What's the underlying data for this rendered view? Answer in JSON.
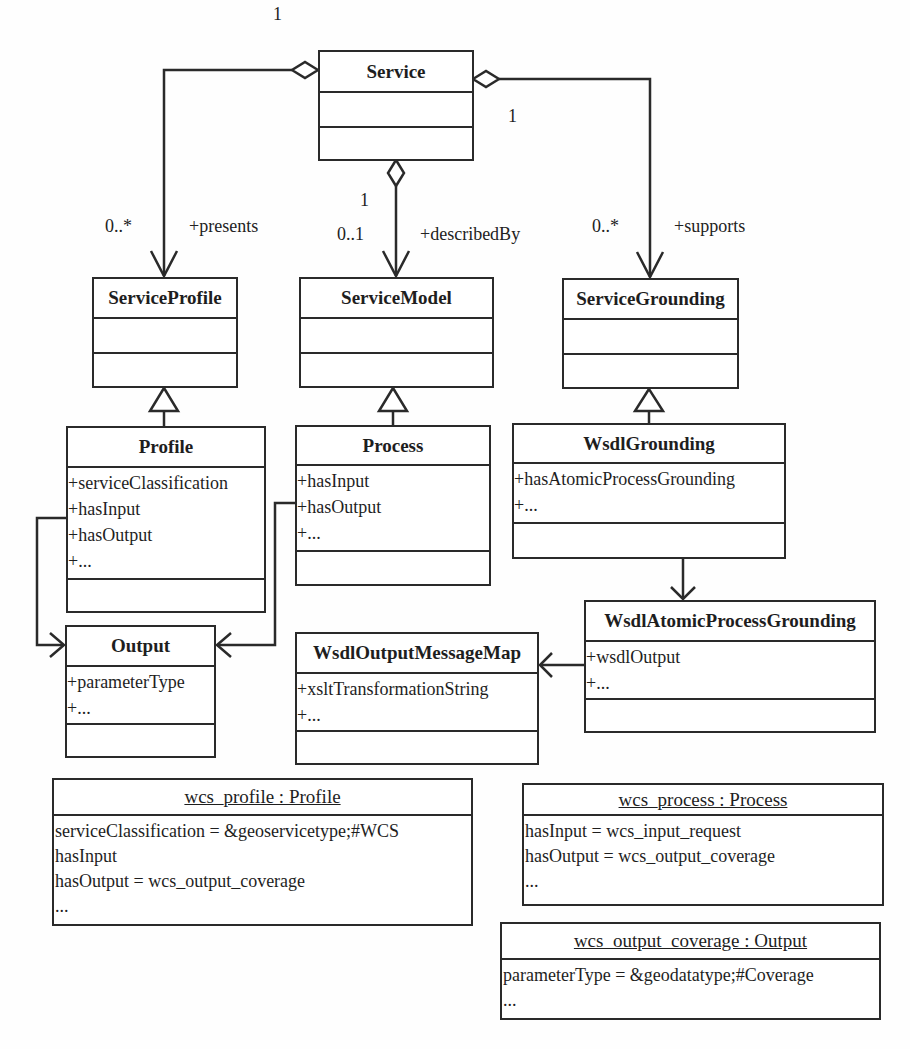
{
  "diagram": {
    "type": "UML class and object diagram",
    "classes": {
      "service": {
        "name": "Service",
        "attributes": [],
        "operations": []
      },
      "service_profile": {
        "name": "ServiceProfile",
        "attributes": [],
        "operations": []
      },
      "service_model": {
        "name": "ServiceModel",
        "attributes": [],
        "operations": []
      },
      "service_grounding": {
        "name": "ServiceGrounding",
        "attributes": [],
        "operations": []
      },
      "profile": {
        "name": "Profile",
        "attributes": [
          "+serviceClassification",
          "+hasInput",
          "+hasOutput",
          "+..."
        ],
        "operations": []
      },
      "process": {
        "name": "Process",
        "attributes": [
          "+hasInput",
          "+hasOutput",
          "+..."
        ],
        "operations": []
      },
      "wsdl_grounding": {
        "name": "WsdlGrounding",
        "attributes": [
          "+hasAtomicProcessGrounding",
          "+..."
        ],
        "operations": []
      },
      "wsdl_atomic_process_grounding": {
        "name": "WsdlAtomicProcessGrounding",
        "attributes": [
          "+wsdlOutput",
          "+..."
        ],
        "operations": []
      },
      "wsdl_output_message_map": {
        "name": "WsdlOutputMessageMap",
        "attributes": [
          "+xsltTransformationString",
          "+..."
        ],
        "operations": []
      },
      "output": {
        "name": "Output",
        "attributes": [
          "+parameterType",
          "+..."
        ],
        "operations": []
      }
    },
    "objects": {
      "wcs_profile": {
        "title": "wcs_profile : Profile",
        "slots": [
          "serviceClassification = &geoservicetype;#WCS",
          "hasInput",
          "hasOutput = wcs_output_coverage",
          "..."
        ]
      },
      "wcs_process": {
        "title": "wcs_process : Process",
        "slots": [
          "hasInput = wcs_input_request",
          "hasOutput = wcs_output_coverage",
          "..."
        ]
      },
      "wcs_output_coverage": {
        "title": "wcs_output_coverage : Output",
        "slots": [
          "parameterType = &geodatatype;#Coverage",
          "..."
        ]
      }
    },
    "associations": {
      "presents": {
        "role": "+presents",
        "source_mult": "1",
        "target_mult": "0..*",
        "from": "Service",
        "to": "ServiceProfile",
        "kind": "aggregation"
      },
      "describedBy": {
        "role": "+describedBy",
        "source_mult": "1",
        "target_mult": "0..1",
        "from": "Service",
        "to": "ServiceModel",
        "kind": "aggregation"
      },
      "supports": {
        "role": "+supports",
        "source_mult": "1",
        "target_mult": "0..*",
        "from": "Service",
        "to": "ServiceGrounding",
        "kind": "aggregation"
      }
    },
    "generalizations": [
      {
        "child": "Profile",
        "parent": "ServiceProfile"
      },
      {
        "child": "Process",
        "parent": "ServiceModel"
      },
      {
        "child": "WsdlGrounding",
        "parent": "ServiceGrounding"
      }
    ],
    "dependencies": [
      {
        "from": "Profile.hasOutput",
        "to": "Output"
      },
      {
        "from": "Process.hasOutput",
        "to": "Output"
      },
      {
        "from": "WsdlGrounding",
        "to": "WsdlAtomicProcessGrounding"
      },
      {
        "from": "WsdlAtomicProcessGrounding.wsdlOutput",
        "to": "WsdlOutputMessageMap"
      }
    ],
    "colors": {
      "line": "#2a2a2a",
      "background": "#fefefe",
      "text": "#1e1e1e"
    }
  }
}
